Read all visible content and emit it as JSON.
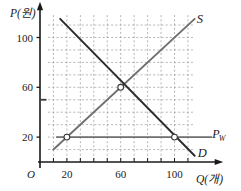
{
  "chart_data": {
    "type": "line",
    "title": "",
    "subtitle": "",
    "xlabel": "Q(개)",
    "ylabel": "P(원)",
    "origin_label": "O",
    "xlim": [
      0,
      130
    ],
    "ylim": [
      0,
      125
    ],
    "grid": true,
    "grid_style": "dashed",
    "grid_color": "#9a9a9a",
    "grid_step_x": 10,
    "grid_step_y": 10,
    "xticks": [
      20,
      60,
      100
    ],
    "xtick_labels": [
      "20",
      "60",
      "100"
    ],
    "yticks": [
      20,
      60,
      100
    ],
    "ytick_labels": [
      "20",
      "60",
      "100"
    ],
    "xminor_ticks": [
      10,
      20,
      30,
      40,
      50,
      60,
      70,
      80,
      90,
      100,
      110
    ],
    "yminor_ticks": [
      10,
      20,
      30,
      40,
      50,
      60,
      70,
      80,
      90,
      100,
      110
    ],
    "legend_position": "inline-curve-ends",
    "series": [
      {
        "name": "S",
        "label": "S",
        "kind": "supply",
        "color": "#6f6f6f",
        "x": [
          10,
          115
        ],
        "y": [
          10,
          115
        ],
        "slope": 1,
        "intercept": 0,
        "label_point": [
          118,
          118
        ]
      },
      {
        "name": "D",
        "label": "D",
        "kind": "demand",
        "color": "#2b2b2b",
        "x": [
          15,
          115
        ],
        "y": [
          115,
          5
        ],
        "slope": -1.1,
        "intercept": 130,
        "label_point": [
          118,
          6
        ]
      },
      {
        "name": "Pw",
        "label": "Pw",
        "label_base": "P",
        "label_sub": "W",
        "kind": "world-price-line",
        "color": "#6f6f6f",
        "x": [
          12,
          128
        ],
        "y": [
          20,
          20
        ],
        "value": 20,
        "label_point": [
          131,
          22
        ]
      }
    ],
    "markers": [
      {
        "name": "supply-at-world-price",
        "x": 20,
        "y": 20,
        "style": "open-circle"
      },
      {
        "name": "market-equilibrium",
        "x": 60,
        "y": 60,
        "style": "open-circle"
      },
      {
        "name": "demand-at-world-price",
        "x": 100,
        "y": 20,
        "style": "open-circle"
      }
    ],
    "axis_tick_mark": {
      "name": "y-axis-mark-50",
      "y": 50
    },
    "annotations": []
  },
  "figure": {
    "background": "#ffffff",
    "axis_color": "#1a1a1a"
  }
}
